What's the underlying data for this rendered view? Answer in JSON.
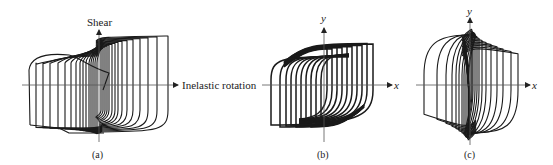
{
  "figure": {
    "panels": [
      {
        "id": "a",
        "caption": "(a)",
        "y_axis_label": "Shear",
        "x_axis_label": "Inelastic rotation",
        "origin": [
          99,
          85
        ],
        "axis_x_range": [
          22,
          178
        ],
        "axis_y_range": [
          30,
          142
        ],
        "loops": {
          "count": 17,
          "right_edges": [
            101,
            103,
            105,
            107,
            109,
            112,
            115,
            118,
            122,
            127,
            133,
            140,
            148,
            157,
            168
          ],
          "left_edges": [
            97,
            95,
            93,
            91,
            89,
            86,
            83,
            80,
            76,
            71,
            65,
            58,
            50,
            43,
            36
          ],
          "top": 37,
          "bottom": 133
        }
      },
      {
        "id": "b",
        "caption": "(b)",
        "y_axis_label": "y",
        "x_axis_label": "x",
        "origin": [
          324,
          85
        ],
        "axis_x_range": [
          262,
          392
        ],
        "axis_y_range": [
          28,
          142
        ],
        "loops": {
          "count": 13,
          "right_edges": [
            327,
            332,
            337,
            342,
            347,
            352,
            357,
            362,
            367,
            373
          ],
          "left_edges": [
            321,
            316,
            311,
            306,
            301,
            296,
            291,
            286,
            280,
            271
          ],
          "top": 40,
          "bottom": 133
        }
      },
      {
        "id": "c",
        "caption": "(c)",
        "y_axis_label": "y",
        "x_axis_label": "x",
        "origin": [
          470,
          85
        ],
        "axis_x_range": [
          416,
          530
        ],
        "axis_y_range": [
          18,
          145
        ],
        "loops": {
          "count": 16,
          "right_edges": [
            471,
            472,
            473,
            475,
            477,
            479,
            482,
            486,
            491,
            497,
            503,
            511,
            518
          ],
          "left_edges": [
            469,
            468,
            466,
            464,
            462,
            459,
            456,
            452,
            446,
            437,
            424
          ],
          "top": 30,
          "bottom": 140
        }
      }
    ]
  }
}
